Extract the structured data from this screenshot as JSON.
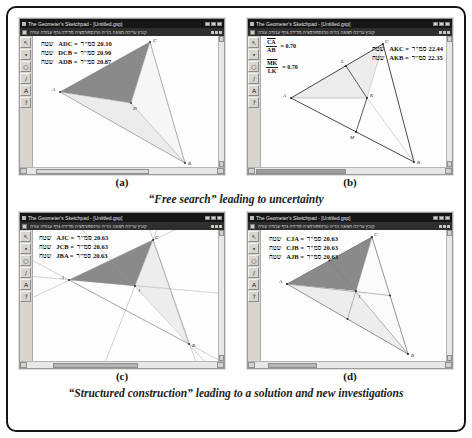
{
  "figure": {
    "captions": {
      "top": "“Free search” leading to uncertainty",
      "bottom": "“Structured construction” leading to a solution and new investigations"
    }
  },
  "window": {
    "title": "The Geometer's Sketchpad - [Untitled.gsp]",
    "menu": "קובץ עריכה תצוגה בנייה טרנספורמציה מדידה גרף עבודה עזרה",
    "tools": [
      {
        "name": "selection-arrow-tool",
        "glyph": "↖"
      },
      {
        "name": "point-tool",
        "glyph": "•"
      },
      {
        "name": "circle-tool",
        "glyph": "○"
      },
      {
        "name": "segment-tool",
        "glyph": "/"
      },
      {
        "name": "label-tool",
        "glyph": "A"
      },
      {
        "name": "help-tool",
        "glyph": "?"
      }
    ]
  },
  "panels": {
    "a": {
      "label": "(a)",
      "measurements": [
        {
          "word": "שטח",
          "expr": "ADC =",
          "unit": "סמ\"ר",
          "value": "20.10"
        },
        {
          "word": "שטח",
          "expr": "DCB =",
          "unit": "סמ\"ר",
          "value": "20.90"
        },
        {
          "word": "שטח",
          "expr": "ADB =",
          "unit": "סמ\"ר",
          "value": "20.87"
        }
      ],
      "points": {
        "A": "A",
        "B": "B",
        "C": "C",
        "D": "D"
      }
    },
    "b": {
      "label": "(b)",
      "ratios": [
        {
          "num": "CA",
          "den": "AB",
          "value": "= 0.70"
        },
        {
          "num": "MK",
          "den": "LK",
          "value": "= 0.70"
        }
      ],
      "measurements": [
        {
          "word": "שטח",
          "expr": "AKC =",
          "unit": "סמ\"ר",
          "value": "22.44"
        },
        {
          "word": "שטח",
          "expr": "AKB =",
          "unit": "סמ\"ר",
          "value": "22.35"
        }
      ],
      "points": {
        "A": "A",
        "B": "B",
        "C": "C",
        "K": "K",
        "L": "L",
        "M": "M"
      }
    },
    "c": {
      "label": "(c)",
      "measurements": [
        {
          "word": "שטח",
          "expr": "AJC =",
          "unit": "סמ\"ר",
          "value": "20.63"
        },
        {
          "word": "שטח",
          "expr": "JCB =",
          "unit": "סמ\"ר",
          "value": "20.63"
        },
        {
          "word": "שטח",
          "expr": "JBA =",
          "unit": "סמ\"ר",
          "value": "20.63"
        }
      ],
      "points": {
        "A": "A",
        "B": "B",
        "C": "C",
        "J": "J"
      }
    },
    "d": {
      "label": "(d)",
      "measurements": [
        {
          "word": "שטח",
          "expr": "CJA =",
          "unit": "סמ\"ר",
          "value": "20.63"
        },
        {
          "word": "שטח",
          "expr": "CJB =",
          "unit": "סמ\"ר",
          "value": "20.63"
        },
        {
          "word": "שטח",
          "expr": "AJB =",
          "unit": "סמ\"ר",
          "value": "20.63"
        }
      ],
      "points": {
        "A": "A",
        "B": "B",
        "C": "C",
        "J": "J"
      }
    }
  },
  "colors": {
    "dark_region": "#8a8a8a",
    "light_region": "#ececec",
    "titlebar": "#161616",
    "toolbar_face": "#d8d5cf"
  }
}
